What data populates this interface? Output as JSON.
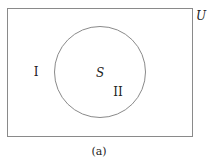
{
  "diagram": {
    "type": "venn",
    "universe_label": "U",
    "set_label": "S",
    "region_outside_label": "I",
    "region_inside_label": "II",
    "caption": "(a)",
    "colors": {
      "stroke": "#8a8a8a",
      "text": "#222222",
      "background": "#ffffff"
    }
  }
}
